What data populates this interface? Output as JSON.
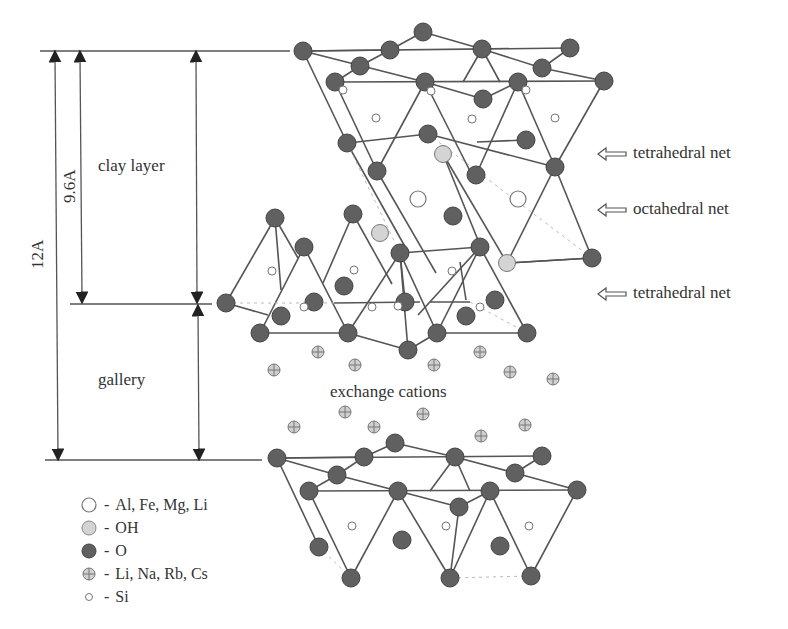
{
  "labels": {
    "clay_layer": "clay layer",
    "gallery": "gallery",
    "dim_12": "12A",
    "dim_96": "9.6A",
    "exchange_cations": "exchange cations"
  },
  "nets": [
    {
      "label": "tetrahedral net"
    },
    {
      "label": "octahedral net"
    },
    {
      "label": "tetrahedral net"
    }
  ],
  "legend": [
    {
      "symbol": "open-large-circle",
      "text": "Al, Fe, Mg, Li"
    },
    {
      "symbol": "light-gray-circle",
      "text": "OH"
    },
    {
      "symbol": "dark-gray-circle",
      "text": "O"
    },
    {
      "symbol": "crossed-circle",
      "text": "Li, Na, Rb, Cs"
    },
    {
      "symbol": "small-open-circle",
      "text": "Si"
    }
  ],
  "colors": {
    "oxygen": "#5e5e5e",
    "hydroxyl": "#d0d0d0",
    "cation": "#8a8a8a",
    "line": "#555555"
  }
}
